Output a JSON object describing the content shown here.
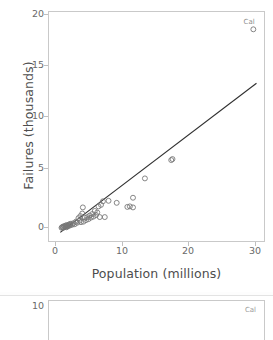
{
  "chart_data": {
    "type": "scatter",
    "title": "",
    "xlabel": "Population (millions)",
    "ylabel": "Failures (thousands)",
    "xlim": [
      -1.5,
      32.8
    ],
    "ylim": [
      -1.2,
      21.3
    ],
    "xticks": [
      0,
      10,
      20,
      30
    ],
    "yticks": [
      0,
      5,
      10,
      15,
      20
    ],
    "grid": false,
    "legend": "none",
    "marker": "open-circle",
    "marker_color": "#777777",
    "line_color": "#2f2f2f",
    "annotations": [
      {
        "label": "Cal",
        "x": 31.0,
        "y": 19.6
      }
    ],
    "series": [
      {
        "name": "States",
        "points": [
          [
            0.5,
            0.1
          ],
          [
            0.6,
            0.15
          ],
          [
            0.7,
            0.2
          ],
          [
            0.8,
            0.1
          ],
          [
            0.9,
            0.25
          ],
          [
            1.0,
            0.2
          ],
          [
            1.1,
            0.3
          ],
          [
            1.2,
            0.2
          ],
          [
            1.25,
            0.35
          ],
          [
            1.3,
            0.15
          ],
          [
            1.4,
            0.3
          ],
          [
            1.5,
            0.25
          ],
          [
            1.6,
            0.4
          ],
          [
            1.7,
            0.3
          ],
          [
            1.8,
            0.45
          ],
          [
            1.9,
            0.35
          ],
          [
            2.0,
            0.5
          ],
          [
            2.2,
            0.4
          ],
          [
            2.4,
            0.55
          ],
          [
            2.6,
            0.45
          ],
          [
            2.8,
            0.7
          ],
          [
            3.0,
            0.6
          ],
          [
            3.2,
            1.05
          ],
          [
            3.4,
            0.8
          ],
          [
            3.5,
            1.25
          ],
          [
            3.6,
            0.65
          ],
          [
            3.8,
            1.5
          ],
          [
            3.9,
            2.1
          ],
          [
            4.0,
            0.7
          ],
          [
            4.2,
            1.1
          ],
          [
            4.4,
            0.85
          ],
          [
            4.6,
            1.15
          ],
          [
            4.8,
            0.95
          ],
          [
            5.0,
            1.3
          ],
          [
            5.2,
            1.1
          ],
          [
            5.4,
            1.45
          ],
          [
            5.6,
            1.2
          ],
          [
            5.8,
            1.75
          ],
          [
            6.0,
            1.35
          ],
          [
            6.2,
            1.6
          ],
          [
            6.4,
            2.2
          ],
          [
            6.6,
            1.15
          ],
          [
            6.8,
            2.35
          ],
          [
            7.1,
            2.7
          ],
          [
            7.4,
            1.15
          ],
          [
            8.0,
            2.75
          ],
          [
            9.3,
            2.55
          ],
          [
            11.0,
            2.15
          ],
          [
            11.4,
            2.2
          ],
          [
            11.9,
            2.1
          ],
          [
            11.9,
            3.05
          ],
          [
            13.8,
            4.95
          ],
          [
            18.0,
            6.75
          ],
          [
            18.2,
            6.85
          ],
          [
            31.1,
            19.6
          ]
        ]
      }
    ],
    "fit_line": {
      "name": "least-squares fit",
      "x_start": 0.3,
      "y_start": -0.35,
      "x_end": 31.6,
      "y_end": 14.3
    }
  },
  "axes": {
    "ylabel": "Failures (thousands)",
    "xlabel": "Population (millions)",
    "ytick_labels": [
      "20",
      "15",
      "10",
      "5",
      "0"
    ],
    "xtick_labels": [
      "0",
      "10",
      "20",
      "30"
    ]
  },
  "annotation": {
    "california": "Cal"
  },
  "panel2": {
    "ytick_label": "10",
    "annotation": "Cal"
  }
}
